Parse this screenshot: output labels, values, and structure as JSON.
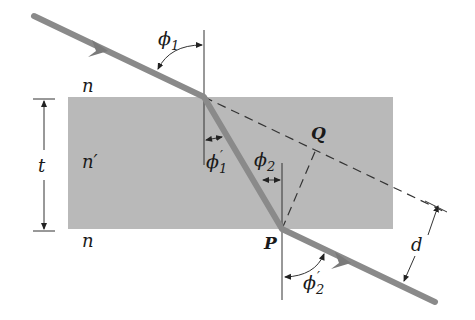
{
  "diagram": {
    "type": "refraction-through-slab",
    "media": {
      "top": "n",
      "slab": "n′",
      "bottom": "n"
    },
    "labels": {
      "thickness": "t",
      "displacement": "d",
      "point_P": "P",
      "point_Q": "Q",
      "phi1": "ϕ",
      "phi1_sub": "1",
      "phi1p": "ϕ",
      "phi1p_sub": "1",
      "phi1p_prime": "′",
      "phi2": "ϕ",
      "phi2_sub": "2",
      "phi2p": "ϕ",
      "phi2p_sub": "2",
      "phi2p_prime": "′"
    },
    "colors": {
      "slab": "#b9b9b9",
      "ray": "#8a8a8a",
      "lines": "#333333",
      "background": "#ffffff"
    }
  }
}
